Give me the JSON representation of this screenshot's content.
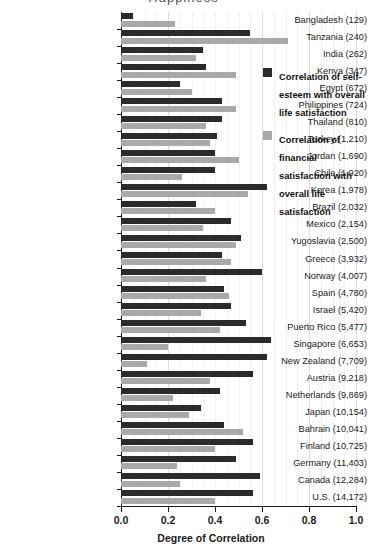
{
  "title_remnant": "Happiness",
  "legend": {
    "position": "inside-right-top",
    "items": [
      {
        "swatch": "dark",
        "color": "#2b2b2b",
        "label": "Correlation of self-esteem with overall life satisfaction"
      },
      {
        "swatch": "light",
        "color": "#a9a9a9",
        "label": "Correlation of financial satisfaction with overall life satisfaction"
      }
    ]
  },
  "axis": {
    "x_title": "Degree of Correlation",
    "x_ticks": [
      "0.0",
      "0.2",
      "0.4",
      "0.6",
      "0.8",
      "1.0"
    ],
    "x_tick_values": [
      0.0,
      0.2,
      0.4,
      0.6,
      0.8,
      1.0
    ],
    "xlim": [
      0.0,
      1.0
    ],
    "grid": true
  },
  "chart_data": {
    "type": "bar",
    "orientation": "horizontal",
    "title": "Happiness",
    "xlabel": "Degree of Correlation",
    "ylabel": "",
    "xlim": [
      0.0,
      1.0
    ],
    "grid": true,
    "legend_position": "inside-right-top",
    "categories": [
      "Bangladesh (129)",
      "Tanzania (240)",
      "India (262)",
      "Kenya (347)",
      "Egypt (672)",
      "Philippines (724)",
      "Thailand (810)",
      "Turkey (1,210)",
      "Jordan (1,690)",
      "Chile (1,920)",
      "Korea (1,978)",
      "Brazil (2,032)",
      "Mexico (2,154)",
      "Yugoslavia (2,500)",
      "Greece (3,932)",
      "Norway (4,007)",
      "Spain (4,780)",
      "Israel (5,420)",
      "Puerto Rico (5,477)",
      "Singapore (6,653)",
      "New Zealand (7,709)",
      "Austria (9,218)",
      "Netherlands (9,869)",
      "Japan (10,154)",
      "Bahrain (10,041)",
      "Finland (10,725)",
      "Germany (11,403)",
      "Canada (12,284)",
      "U.S. (14,172)"
    ],
    "series": [
      {
        "name": "Correlation of self-esteem with overall life satisfaction",
        "color": "#2b2b2b",
        "values": [
          0.05,
          0.55,
          0.35,
          0.36,
          0.25,
          0.43,
          0.43,
          0.41,
          0.4,
          0.4,
          0.62,
          0.32,
          0.47,
          0.51,
          0.43,
          0.6,
          0.44,
          0.47,
          0.53,
          0.64,
          0.62,
          0.56,
          0.42,
          0.34,
          0.44,
          0.56,
          0.49,
          0.59,
          0.56
        ]
      },
      {
        "name": "Correlation of financial satisfaction with overall life satisfaction",
        "color": "#a9a9a9",
        "values": [
          0.23,
          0.71,
          0.32,
          0.49,
          0.3,
          0.49,
          0.36,
          0.38,
          0.5,
          0.26,
          0.54,
          0.4,
          0.35,
          0.49,
          0.47,
          0.36,
          0.46,
          0.34,
          0.42,
          0.2,
          0.11,
          0.38,
          0.22,
          0.29,
          0.52,
          0.4,
          0.24,
          0.25,
          0.4
        ]
      }
    ]
  }
}
